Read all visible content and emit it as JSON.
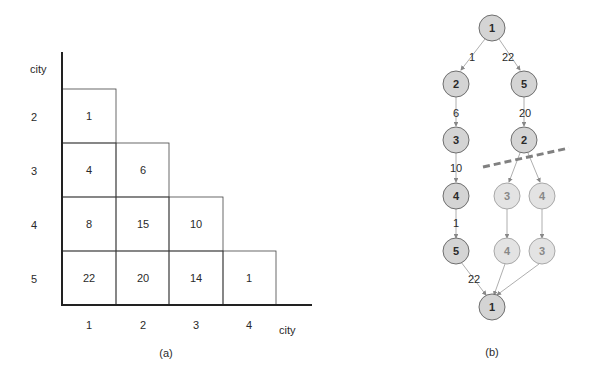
{
  "panel_a": {
    "y_axis_label": "city",
    "x_axis_label": "city",
    "row_labels": [
      "2",
      "3",
      "4",
      "5"
    ],
    "col_labels": [
      "1",
      "2",
      "3",
      "4"
    ],
    "matrix": [
      [
        "1"
      ],
      [
        "4",
        "6"
      ],
      [
        "8",
        "15",
        "10"
      ],
      [
        "22",
        "20",
        "14",
        "1"
      ]
    ],
    "caption": "(a)"
  },
  "panel_b": {
    "nodes": {
      "root": "1",
      "l1": "2",
      "r1": "5",
      "l2": "3",
      "r2": "2",
      "l3": "4",
      "g1": "3",
      "g2": "4",
      "l4": "5",
      "g3": "4",
      "g4": "3",
      "end": "1"
    },
    "edges": {
      "root_l1": "1",
      "root_r1": "22",
      "l1_l2": "6",
      "r1_r2": "20",
      "l2_l3": "10",
      "l3_l4": "1",
      "l4_end": "22"
    },
    "caption": "(b)"
  },
  "colors": {
    "node_fill": "#d4d4d4",
    "node_stroke": "#6e6e6e",
    "pruned_fill": "#e2e2e2",
    "dash": "#808080"
  }
}
